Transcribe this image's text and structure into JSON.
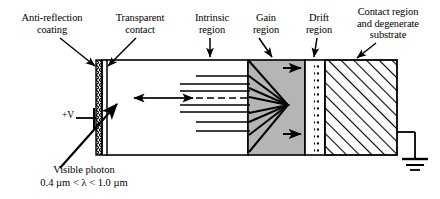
{
  "diagram": {
    "title_labels": {
      "anti_reflection": "Anti-reflection\ncoating",
      "transparent_contact": "Transparent\ncontact",
      "intrinsic": "Intrinsic\nregion",
      "gain": "Gain\nregion",
      "drift": "Drift\nregion",
      "contact_substrate": "Contact region\nand degenerate\nsubstrate"
    },
    "terminals": {
      "bias": "+V",
      "ground": "ground-symbol"
    },
    "carriers": {
      "electron": "e",
      "hole": "h",
      "electron_upper": "e",
      "electron_lower": "e"
    },
    "gain_labels": {
      "upper": "D",
      "upper_sub": "+",
      "lower": "D",
      "lower_sub": "+"
    },
    "photon": {
      "caption": "Visible photon",
      "wavelength": "0.4 µm < λ < 1.0 µm"
    },
    "colors": {
      "stroke": "#000000",
      "gain_fill": "#b5b5b5",
      "background": "#ffffff"
    }
  }
}
